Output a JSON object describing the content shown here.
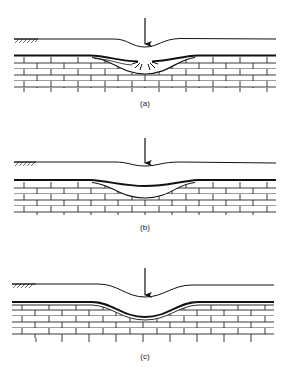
{
  "figure": {
    "panels": [
      {
        "id": "a",
        "label": "(a)",
        "description": "Soft layer over brick-pattern rock stratum; top layer sags into a cavity with radiating crack marks beneath a downward arrow"
      },
      {
        "id": "b",
        "label": "(b)",
        "description": "Surface dips slightly; thin layer bends downward into the stratum forming a lens-shaped depression"
      },
      {
        "id": "c",
        "label": "(c)",
        "description": "Pronounced surface depression; double-lined layer follows the downward bend into the stratum"
      }
    ],
    "symbols": {
      "arrow": "down-arrow-load-icon",
      "ground": "ground-hatch-icon",
      "rock": "brick-limestone-pattern"
    },
    "colors": {
      "line": "#1a1a1a",
      "background": "#ffffff"
    }
  }
}
